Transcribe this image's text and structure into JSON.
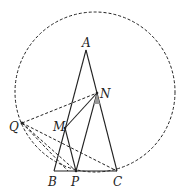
{
  "diagram": {
    "circle": {
      "cx": 95,
      "cy": 92,
      "r": 80
    },
    "points": {
      "A": {
        "label": "A",
        "x": 86,
        "y": 50
      },
      "N": {
        "label": "N",
        "x": 97,
        "y": 93
      },
      "M": {
        "label": "M",
        "x": 65,
        "y": 128
      },
      "Q": {
        "label": "Q",
        "x": 22,
        "y": 123
      },
      "B": {
        "label": "B",
        "x": 54,
        "y": 171
      },
      "P": {
        "label": "P",
        "x": 76,
        "y": 171
      },
      "C": {
        "label": "C",
        "x": 117,
        "y": 171
      }
    },
    "solid_segments": [
      "AB",
      "AC",
      "BC",
      "MN",
      "MP",
      "NP"
    ],
    "dashed_segments": [
      "QN",
      "QP",
      "QC",
      "QB",
      "PC-arc"
    ],
    "angle_mark": "ANP at N"
  }
}
